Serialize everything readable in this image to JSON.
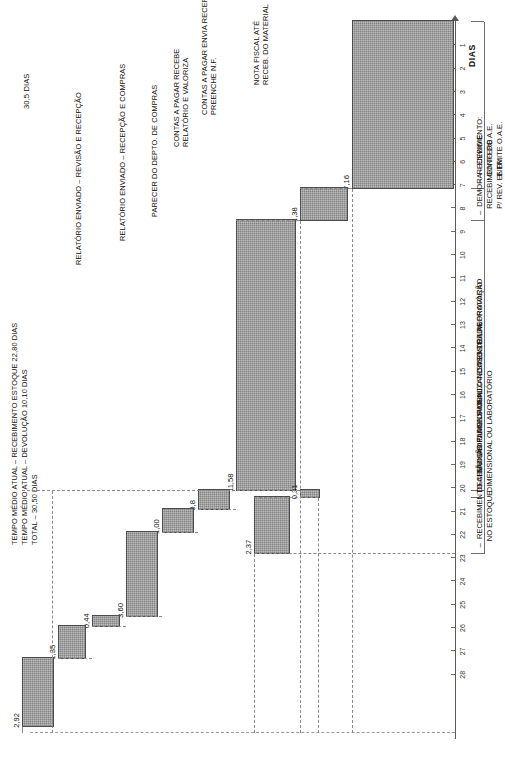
{
  "header": {
    "lines": [
      "TEMPO MÉDIO ATUAL – RECEBIMENTO ESTOQUE 22,80 DIAS",
      "TEMPO MÉDIO ATUAL – DEVOLUÇÃO 10,10 DIAS",
      "TOTAL – 30,50 DIAS"
    ]
  },
  "axis": {
    "title": "DIAS",
    "total_annotation": "30,5 DIAS",
    "ticks": [
      "1",
      "2",
      "3",
      "4",
      "5",
      "6",
      "7",
      "8",
      "9",
      "10",
      "11",
      "12",
      "13",
      "14",
      "15",
      "16",
      "17",
      "18",
      "19",
      "20",
      "21",
      "22",
      "23",
      "24",
      "25",
      "26",
      "27",
      "28"
    ]
  },
  "group_labels": [
    "–  RECEBIMENTO:\n   CONFERE\n   E EMITE O.A.E.",
    "–  DEMORA – ENVIO E\n   RECEBIMENTO DO A.E.\n   P/ REV. ENTR.",
    "–  REVISÃO DIMENSIONAL – TESTES DE LABORATÓRIO",
    "DECISÃO DO PLANEJAMENTO – CASOS DE REPROVAÇÃO\nDIMENSIONAL OU LABORATÓRIO",
    "–  RECEBIMENTO ALMOXARIFADO OFICIALIZANDO ENTRADA\n   NO ESTOQUE"
  ],
  "chart_data": {
    "type": "bar",
    "title": "TEMPO MÉDIO ATUAL – RECEBIMENTO ESTOQUE 22,80 DIAS",
    "xlabel": "",
    "ylabel": "DIAS",
    "ylim": [
      0,
      30.5
    ],
    "grid": false,
    "legend": "none",
    "orientation": "waterfall-cascade (rotated 90°)",
    "categories": [
      "RECEBIMENTO: CONFERE E EMITE O.A.E.",
      "DEMORA – ENVIO E RECEBIMENTO DO A.E. P/ REV. ENTR.",
      "REVISÃO DIMENSIONAL – TESTES DE LABORATÓRIO",
      "RELATÓRIO ENVIADO – REVISÃO E RECEPÇÃO",
      "RELATÓRIO ENVIADO – RECEPÇÃO E COMPRAS",
      "PARECER DO DEPTO. DE COMPRAS",
      "CONTAS A PAGAR RECEBE RELATÓRIO E VALORIZA",
      "CONTAS A PAGAR ENVIA RECEPÇÃO PREENCHE N.F.",
      "NOTA FISCAL ATÉ RECEB. DO MATERIAL",
      "DECISÃO DO PLANEJAMENTO – CASOS DE REPROVAÇÃO DIMENSIONAL OU LABORATÓRIO",
      "RECEBIMENTO ALMOXARIFADO OFICIALIZANDO ENTRADA NO ESTOQUE"
    ],
    "values": [
      7.16,
      1.38,
      11.58,
      0.8,
      1.0,
      3.6,
      0.44,
      1.35,
      2.92,
      0.31,
      2.37
    ],
    "value_labels": [
      "7,16",
      "1,38",
      "11,58",
      "0,8",
      "1,00",
      "3,60",
      "0,44",
      "1,35",
      "2,92",
      "0,31",
      "2,37"
    ],
    "cumulative_start": [
      0,
      7.16,
      8.54,
      20.12,
      20.92,
      21.92,
      25.52,
      25.96,
      27.31,
      20.12,
      20.43
    ],
    "cumulative_end": [
      7.16,
      8.54,
      20.12,
      20.92,
      21.92,
      25.52,
      25.96,
      27.31,
      30.23,
      20.43,
      22.8
    ],
    "total": 30.5
  },
  "bar_annotations": [
    "RELATÓRIO ENVIADO – REVISÃO E RECEPÇÃO",
    "RELATÓRIO ENVIADO – RECEPÇÃO E COMPRAS",
    "PARECER DO DEPTO. DE COMPRAS",
    "CONTAS A PAGAR RECEBE\nRELATÓRIO E VALORIZA",
    "CONTAS A PAGAR ENVIA RECEPÇÃO\nPREENCHE N.F.",
    "NOTA FISCAL ATÉ\nRECEB. DO MATERIAL"
  ]
}
